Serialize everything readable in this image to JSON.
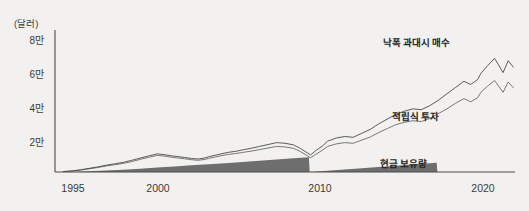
{
  "chart_data": {
    "type": "line",
    "title": "",
    "xlabel": "",
    "ylabel": "(달러)",
    "y_unit_label": "(달러)",
    "xlim": [
      1994,
      2021
    ],
    "ylim": [
      0,
      90000
    ],
    "grid": false,
    "legend_position": "inline-annotations",
    "x_ticks": [
      "1995",
      "2000",
      "2010",
      "2020"
    ],
    "x_tick_values": [
      1995,
      2000,
      2010,
      2020
    ],
    "y_ticks": [
      "2만",
      "4만",
      "6만",
      "8만"
    ],
    "y_tick_values": [
      20000,
      40000,
      60000,
      80000
    ],
    "series": [
      {
        "name": "낙폭 과대시 매수",
        "style": "line",
        "color": "#4a4a4a",
        "x": [
          1994.5,
          1995,
          1995.5,
          1996,
          1996.5,
          1997,
          1997.5,
          1998,
          1998.5,
          1999,
          1999.5,
          2000,
          2000.4,
          2000.8,
          2001.2,
          2001.6,
          2002,
          2002.4,
          2002.8,
          2003,
          2003.4,
          2003.8,
          2004.2,
          2004.6,
          2005,
          2005.5,
          2006,
          2006.5,
          2007,
          2007.5,
          2008,
          2008.4,
          2008.8,
          2009,
          2009.3,
          2009.7,
          2010,
          2010.5,
          2011,
          2011.5,
          2012,
          2012.5,
          2013,
          2013.5,
          2014,
          2014.5,
          2015,
          2015.5,
          2016,
          2016.5,
          2017,
          2017.5,
          2018,
          2018.4,
          2018.8,
          2019,
          2019.4,
          2019.8,
          2020,
          2020.3,
          2020.6,
          2020.9
        ],
        "y": [
          300,
          700,
          1400,
          2300,
          3200,
          4300,
          5200,
          6100,
          7400,
          8800,
          10200,
          11500,
          11000,
          10300,
          9800,
          9200,
          8600,
          8200,
          8900,
          9600,
          10600,
          11600,
          12500,
          13100,
          14000,
          15000,
          16200,
          17400,
          18600,
          18200,
          17200,
          15000,
          12200,
          10800,
          13500,
          16500,
          19500,
          21500,
          22500,
          22000,
          24500,
          27000,
          30500,
          33500,
          36500,
          38500,
          40000,
          39500,
          42000,
          45500,
          49500,
          53500,
          57500,
          55500,
          58500,
          62500,
          67500,
          72000,
          68500,
          63000,
          70500,
          66500
        ]
      },
      {
        "name": "적립식 투자",
        "style": "line",
        "color": "#6a6a6a",
        "x": [
          1994.5,
          1995,
          1995.5,
          1996,
          1996.5,
          1997,
          1997.5,
          1998,
          1998.5,
          1999,
          1999.5,
          2000,
          2000.4,
          2000.8,
          2001.2,
          2001.6,
          2002,
          2002.4,
          2002.8,
          2003,
          2003.4,
          2003.8,
          2004.2,
          2004.6,
          2005,
          2005.5,
          2006,
          2006.5,
          2007,
          2007.5,
          2008,
          2008.4,
          2008.8,
          2009,
          2009.3,
          2009.7,
          2010,
          2010.5,
          2011,
          2011.5,
          2012,
          2012.5,
          2013,
          2013.5,
          2014,
          2014.5,
          2015,
          2015.5,
          2016,
          2016.5,
          2017,
          2017.5,
          2018,
          2018.4,
          2018.8,
          2019,
          2019.4,
          2019.8,
          2020,
          2020.3,
          2020.6,
          2020.9
        ],
        "y": [
          250,
          600,
          1200,
          2000,
          2800,
          3800,
          4600,
          5400,
          6600,
          8000,
          9300,
          10500,
          10100,
          9400,
          8900,
          8400,
          7800,
          7400,
          8000,
          8600,
          9500,
          10400,
          11200,
          11700,
          12400,
          13200,
          14200,
          15200,
          16200,
          15900,
          15000,
          13000,
          10400,
          9000,
          11200,
          13800,
          16200,
          17800,
          18600,
          18200,
          20200,
          22200,
          25000,
          27500,
          30000,
          31500,
          32500,
          32000,
          34000,
          37000,
          40000,
          43500,
          46500,
          44500,
          47000,
          50500,
          54500,
          58000,
          55000,
          50500,
          57000,
          53500
        ]
      },
      {
        "name": "현금 보유량",
        "style": "area",
        "color": "#6e6e6e",
        "x": [
          1995,
          1996,
          1997,
          1998,
          1999,
          2000,
          2001,
          2002,
          2003,
          2004,
          2005,
          2006,
          2007,
          2008,
          2008.9,
          2008.95,
          2009,
          2010,
          2011,
          2012,
          2013,
          2014,
          2015,
          2016,
          2016.4,
          2016.45,
          2017,
          2018,
          2019,
          2020,
          2020.9
        ],
        "y": [
          0,
          400,
          900,
          1500,
          2100,
          2800,
          3500,
          4200,
          4900,
          5600,
          6300,
          7100,
          7900,
          8700,
          9300,
          0,
          0,
          800,
          1600,
          2400,
          3200,
          4000,
          4800,
          5500,
          5800,
          0,
          0,
          0,
          0,
          0,
          0
        ]
      }
    ],
    "annotations": [
      {
        "text": "낙폭 과대시 매수",
        "x_px": 383,
        "y_px": 41
      },
      {
        "text": "적립식 투자",
        "x_px": 392,
        "y_px": 115
      },
      {
        "text": "현금 보유량",
        "x_px": 380,
        "y_px": 162
      }
    ]
  },
  "axis": {
    "unit_label": "(달러)",
    "y_labels": [
      "8만",
      "6만",
      "4만",
      "2만"
    ],
    "x_labels": [
      "1995",
      "2000",
      "2010",
      "2020"
    ]
  },
  "colors": {
    "background": "#f2f1ef",
    "axis": "#4a4a4a",
    "line_primary": "#4a4a4a",
    "line_secondary": "#6a6a6a",
    "area_cash": "#6e6e6e",
    "text": "#3a3a3a"
  }
}
